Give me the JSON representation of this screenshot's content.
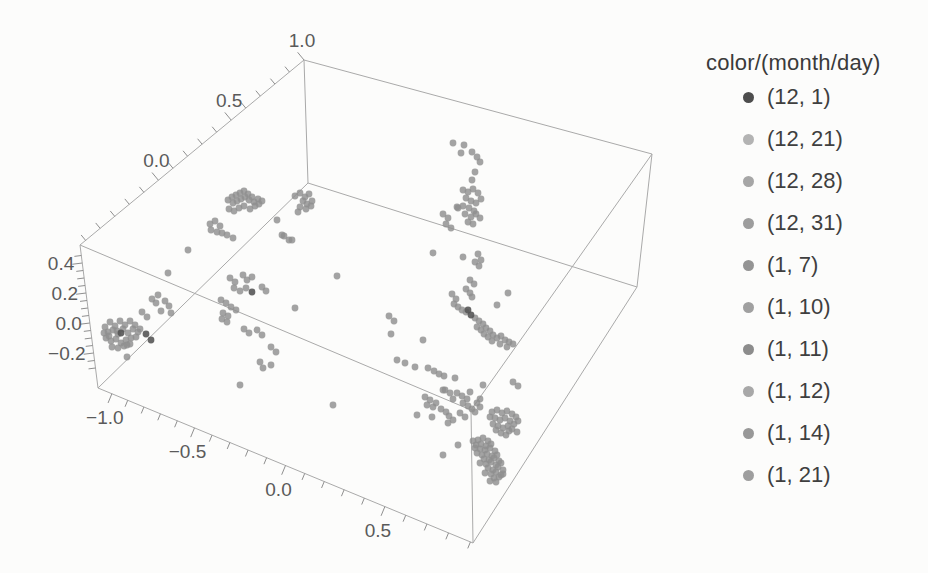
{
  "legend": {
    "title": "color/(month/day)",
    "entries": [
      {
        "label": "(12, 1)",
        "color": "#4d4d4d"
      },
      {
        "label": "(12, 21)",
        "color": "#b3b3b3"
      },
      {
        "label": "(12, 28)",
        "color": "#a6a6a6"
      },
      {
        "label": "(12, 31)",
        "color": "#9d9d9d"
      },
      {
        "label": "(1, 7)",
        "color": "#949494"
      },
      {
        "label": "(1, 10)",
        "color": "#a0a0a0"
      },
      {
        "label": "(1, 11)",
        "color": "#8c8c8c"
      },
      {
        "label": "(1, 12)",
        "color": "#a8a8a8"
      },
      {
        "label": "(1, 14)",
        "color": "#989898"
      },
      {
        "label": "(1, 21)",
        "color": "#9e9e9e"
      }
    ]
  },
  "chart_data": {
    "type": "scatter3d",
    "title": "",
    "legend_title": "color/(month/day)",
    "xticks": [
      "−1.0",
      "−0.5",
      "0.0",
      "0.5"
    ],
    "yticks": [
      "0.0",
      "0.5",
      "1.0"
    ],
    "zticks": [
      "−0.2",
      "0.0",
      "0.2",
      "0.4"
    ],
    "xlim": [
      -1.1,
      0.95
    ],
    "ylim": [
      -0.55,
      1.0
    ],
    "zlim": [
      -0.33,
      0.47
    ],
    "grid": false,
    "legend_position": "right",
    "style": {
      "edge_color": "#a9a9a9",
      "tick_color": "#8f8f8f",
      "label_color": "#5a5a5a",
      "point_color": "#8f8f8f",
      "dark_point_color": "#565656",
      "point_radius": 3.4,
      "label_font_size": 19
    },
    "box_corners": {
      "lt": [
        80,
        245
      ],
      "bt": [
        304,
        60
      ],
      "rt": [
        652,
        154
      ],
      "ft": [
        471,
        410
      ],
      "lb": [
        98,
        388
      ],
      "bb": [
        308,
        183
      ],
      "rb": [
        637,
        287
      ],
      "fb": [
        473,
        543
      ]
    },
    "box_edges": [
      [
        "lt",
        "bt"
      ],
      [
        "bt",
        "rt"
      ],
      [
        "rt",
        "ft"
      ],
      [
        "ft",
        "lt"
      ],
      [
        "lb",
        "fb"
      ],
      [
        "fb",
        "rb"
      ],
      [
        "rb",
        "bb"
      ],
      [
        "bb",
        "lb"
      ],
      [
        "lb",
        "lt"
      ],
      [
        "fb",
        "ft"
      ],
      [
        "rb",
        "rt"
      ],
      [
        "bb",
        "bt"
      ]
    ],
    "axes": [
      {
        "id": "x-bottom",
        "p0": [
          98,
          388
        ],
        "p1": [
          473,
          543
        ],
        "coef": [
          0.5,
          0.5077,
          0.0447
        ],
        "v_min": -1.0,
        "v_max": 0.9,
        "step": 0.1,
        "tick_dir": [
          -0.382,
          0.924
        ],
        "tick_len": 7,
        "major_len": 10,
        "labels": [
          {
            "v": -1.0,
            "text": "−1.0"
          },
          {
            "v": -0.5,
            "text": "−0.5"
          },
          {
            "v": 0.0,
            "text": "0.0"
          },
          {
            "v": 0.5,
            "text": "0.5"
          }
        ],
        "label_offset": [
          -7,
          30
        ],
        "anchor": "middle"
      },
      {
        "id": "y-top-left",
        "p0": [
          80,
          245
        ],
        "p1": [
          304,
          60
        ],
        "coef": [
          0.35,
          0.65,
          0
        ],
        "v_min": -0.5,
        "v_max": 1.0,
        "step": 0.1,
        "tick_dir": [
          -0.637,
          -0.771
        ],
        "tick_len": 7,
        "major_len": 10,
        "labels": [
          {
            "v": 0.0,
            "text": "0.0"
          },
          {
            "v": 0.5,
            "text": "0.5"
          },
          {
            "v": 1.0,
            "text": "1.0"
          }
        ],
        "label_offset": [
          -2,
          -13
        ],
        "anchor": "middle"
      },
      {
        "id": "z-left",
        "p0": [
          98,
          388
        ],
        "p1": [
          80,
          245
        ],
        "coef": [
          0.4545,
          1.049,
          0
        ],
        "v_min": -0.3,
        "v_max": 0.45,
        "step": 0.05,
        "tick_dir": [
          -0.992,
          0.125
        ],
        "tick_len": 7,
        "major_len": 10,
        "labels": [
          {
            "v": -0.2,
            "text": "−0.2"
          },
          {
            "v": 0.0,
            "text": "0.0"
          },
          {
            "v": 0.2,
            "text": "0.2"
          },
          {
            "v": 0.4,
            "text": "0.4"
          }
        ],
        "label_offset": [
          -8,
          7
        ],
        "anchor": "end"
      }
    ],
    "points": [
      [
        105,
        327
      ],
      [
        110,
        322
      ],
      [
        115,
        326
      ],
      [
        120,
        321
      ],
      [
        125,
        325
      ],
      [
        130,
        321
      ],
      [
        135,
        325
      ],
      [
        108,
        332
      ],
      [
        113,
        330
      ],
      [
        118,
        334
      ],
      [
        123,
        329
      ],
      [
        128,
        333
      ],
      [
        133,
        329
      ],
      [
        138,
        332
      ],
      [
        106,
        338
      ],
      [
        111,
        341
      ],
      [
        116,
        339
      ],
      [
        121,
        343
      ],
      [
        126,
        340
      ],
      [
        131,
        338
      ],
      [
        136,
        337
      ],
      [
        112,
        347
      ],
      [
        118,
        348
      ],
      [
        124,
        346
      ],
      [
        130,
        344
      ],
      [
        104,
        333
      ],
      [
        140,
        329
      ],
      [
        117,
        331
      ],
      [
        127,
        345
      ],
      [
        109,
        336
      ],
      [
        142,
        312
      ],
      [
        147,
        317
      ],
      [
        152,
        299
      ],
      [
        156,
        303
      ],
      [
        161,
        311
      ],
      [
        165,
        301
      ],
      [
        169,
        306
      ],
      [
        171,
        313
      ],
      [
        168,
        273
      ],
      [
        158,
        295
      ],
      [
        127,
        357
      ],
      [
        228,
        200
      ],
      [
        232,
        197
      ],
      [
        236,
        195
      ],
      [
        240,
        193
      ],
      [
        244,
        191
      ],
      [
        248,
        194
      ],
      [
        252,
        197
      ],
      [
        233,
        203
      ],
      [
        237,
        201
      ],
      [
        241,
        199
      ],
      [
        245,
        197
      ],
      [
        249,
        200
      ],
      [
        254,
        202
      ],
      [
        258,
        199
      ],
      [
        262,
        201
      ],
      [
        229,
        209
      ],
      [
        234,
        211
      ],
      [
        239,
        208
      ],
      [
        244,
        206
      ],
      [
        250,
        209
      ],
      [
        255,
        206
      ],
      [
        259,
        204
      ],
      [
        210,
        224
      ],
      [
        215,
        221
      ],
      [
        220,
        226
      ],
      [
        211,
        230
      ],
      [
        217,
        232
      ],
      [
        227,
        235
      ],
      [
        233,
        238
      ],
      [
        188,
        250
      ],
      [
        222,
        233
      ],
      [
        295,
        196
      ],
      [
        300,
        193
      ],
      [
        305,
        197
      ],
      [
        309,
        194
      ],
      [
        303,
        201
      ],
      [
        307,
        204
      ],
      [
        312,
        201
      ],
      [
        300,
        207
      ],
      [
        306,
        209
      ],
      [
        311,
        206
      ],
      [
        298,
        212
      ],
      [
        277,
        220
      ],
      [
        282,
        235
      ],
      [
        292,
        240
      ],
      [
        284,
        236
      ],
      [
        289,
        240
      ],
      [
        230,
        278
      ],
      [
        235,
        282
      ],
      [
        243,
        275
      ],
      [
        247,
        280
      ],
      [
        252,
        277
      ],
      [
        234,
        288
      ],
      [
        240,
        291
      ],
      [
        246,
        288
      ],
      [
        262,
        287
      ],
      [
        266,
        291
      ],
      [
        221,
        300
      ],
      [
        226,
        303
      ],
      [
        231,
        307
      ],
      [
        236,
        310
      ],
      [
        223,
        313
      ],
      [
        228,
        316
      ],
      [
        222,
        319
      ],
      [
        227,
        322
      ],
      [
        244,
        329
      ],
      [
        249,
        333
      ],
      [
        257,
        330
      ],
      [
        262,
        335
      ],
      [
        271,
        347
      ],
      [
        276,
        352
      ],
      [
        260,
        362
      ],
      [
        263,
        368
      ],
      [
        271,
        365
      ],
      [
        240,
        385
      ],
      [
        295,
        308
      ],
      [
        337,
        276
      ],
      [
        333,
        405
      ],
      [
        389,
        316
      ],
      [
        394,
        321
      ],
      [
        391,
        334
      ],
      [
        397,
        360
      ],
      [
        405,
        363
      ],
      [
        415,
        367
      ],
      [
        453,
        143
      ],
      [
        464,
        145
      ],
      [
        461,
        153
      ],
      [
        472,
        152
      ],
      [
        477,
        157
      ],
      [
        480,
        162
      ],
      [
        475,
        172
      ],
      [
        472,
        180
      ],
      [
        463,
        190
      ],
      [
        468,
        192
      ],
      [
        473,
        189
      ],
      [
        478,
        193
      ],
      [
        466,
        198
      ],
      [
        471,
        201
      ],
      [
        476,
        203
      ],
      [
        481,
        199
      ],
      [
        463,
        206
      ],
      [
        469,
        208
      ],
      [
        474,
        211
      ],
      [
        458,
        208
      ],
      [
        465,
        214
      ],
      [
        471,
        217
      ],
      [
        476,
        214
      ],
      [
        480,
        218
      ],
      [
        468,
        222
      ],
      [
        473,
        224
      ],
      [
        443,
        214
      ],
      [
        448,
        218
      ],
      [
        446,
        224
      ],
      [
        451,
        228
      ],
      [
        433,
        253
      ],
      [
        463,
        257
      ],
      [
        478,
        254
      ],
      [
        481,
        260
      ],
      [
        475,
        262
      ],
      [
        457,
        207
      ],
      [
        479,
        266
      ],
      [
        470,
        280
      ],
      [
        474,
        284
      ],
      [
        466,
        289
      ],
      [
        470,
        293
      ],
      [
        472,
        297
      ],
      [
        452,
        294
      ],
      [
        456,
        299
      ],
      [
        454,
        304
      ],
      [
        458,
        307
      ],
      [
        462,
        310
      ],
      [
        466,
        312
      ],
      [
        497,
        305
      ],
      [
        508,
        293
      ],
      [
        423,
        340
      ],
      [
        475,
        318
      ],
      [
        479,
        321
      ],
      [
        483,
        324
      ],
      [
        477,
        327
      ],
      [
        481,
        330
      ],
      [
        486,
        328
      ],
      [
        490,
        331
      ],
      [
        484,
        334
      ],
      [
        488,
        337
      ],
      [
        493,
        335
      ],
      [
        497,
        338
      ],
      [
        501,
        336
      ],
      [
        505,
        340
      ],
      [
        509,
        342
      ],
      [
        500,
        344
      ],
      [
        507,
        347
      ],
      [
        513,
        344
      ],
      [
        492,
        341
      ],
      [
        428,
        368
      ],
      [
        434,
        371
      ],
      [
        439,
        374
      ],
      [
        444,
        376
      ],
      [
        455,
        378
      ],
      [
        425,
        397
      ],
      [
        430,
        400
      ],
      [
        436,
        403
      ],
      [
        427,
        405
      ],
      [
        433,
        407
      ],
      [
        445,
        390
      ],
      [
        450,
        393
      ],
      [
        453,
        399
      ],
      [
        417,
        415
      ],
      [
        432,
        417
      ],
      [
        441,
        409
      ],
      [
        446,
        412
      ],
      [
        449,
        416
      ],
      [
        453,
        420
      ],
      [
        460,
        413
      ],
      [
        465,
        417
      ],
      [
        448,
        423
      ],
      [
        457,
        393
      ],
      [
        462,
        396
      ],
      [
        467,
        399
      ],
      [
        470,
        392
      ],
      [
        463,
        403
      ],
      [
        468,
        406
      ],
      [
        472,
        409
      ],
      [
        477,
        403
      ],
      [
        480,
        407
      ],
      [
        475,
        412
      ],
      [
        480,
        399
      ],
      [
        483,
        385
      ],
      [
        490,
        417
      ],
      [
        443,
        390
      ],
      [
        513,
        382
      ],
      [
        518,
        386
      ],
      [
        492,
        412
      ],
      [
        497,
        410
      ],
      [
        502,
        413
      ],
      [
        507,
        411
      ],
      [
        512,
        414
      ],
      [
        516,
        417
      ],
      [
        495,
        418
      ],
      [
        500,
        420
      ],
      [
        505,
        418
      ],
      [
        510,
        421
      ],
      [
        514,
        424
      ],
      [
        518,
        421
      ],
      [
        493,
        424
      ],
      [
        498,
        426
      ],
      [
        503,
        428
      ],
      [
        508,
        426
      ],
      [
        512,
        429
      ],
      [
        517,
        432
      ],
      [
        496,
        430
      ],
      [
        501,
        433
      ],
      [
        506,
        435
      ],
      [
        509,
        431
      ],
      [
        478,
        440
      ],
      [
        483,
        438
      ],
      [
        488,
        441
      ],
      [
        476,
        445
      ],
      [
        481,
        444
      ],
      [
        486,
        446
      ],
      [
        491,
        444
      ],
      [
        480,
        449
      ],
      [
        485,
        450
      ],
      [
        490,
        448
      ],
      [
        495,
        451
      ],
      [
        477,
        453
      ],
      [
        482,
        455
      ],
      [
        487,
        454
      ],
      [
        492,
        456
      ],
      [
        497,
        455
      ],
      [
        484,
        459
      ],
      [
        489,
        460
      ],
      [
        494,
        458
      ],
      [
        499,
        461
      ],
      [
        480,
        463
      ],
      [
        486,
        464
      ],
      [
        491,
        462
      ],
      [
        496,
        465
      ],
      [
        501,
        463
      ],
      [
        488,
        468
      ],
      [
        493,
        470
      ],
      [
        498,
        467
      ],
      [
        503,
        470
      ],
      [
        485,
        473
      ],
      [
        491,
        474
      ],
      [
        496,
        472
      ],
      [
        501,
        475
      ],
      [
        494,
        478
      ],
      [
        499,
        477
      ],
      [
        490,
        481
      ],
      [
        496,
        482
      ],
      [
        503,
        474
      ],
      [
        475,
        448
      ],
      [
        473,
        441
      ],
      [
        458,
        445
      ],
      [
        443,
        455
      ]
    ],
    "dark_points": [
      [
        121,
        333
      ],
      [
        146,
        334
      ],
      [
        151,
        340
      ],
      [
        252,
        292
      ],
      [
        471,
        315
      ],
      [
        468,
        310
      ]
    ]
  }
}
